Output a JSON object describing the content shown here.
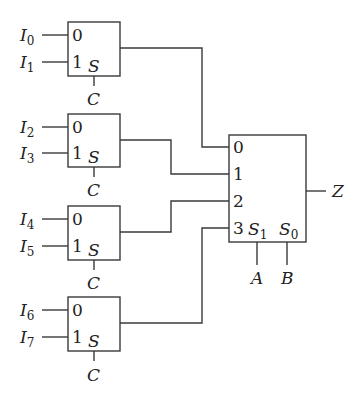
{
  "diagram": {
    "colors": {
      "line": "#3a3a3a",
      "text": "#222222",
      "background": "#ffffff"
    },
    "first_stage": [
      {
        "id": "mux2-0",
        "inputs": [
          {
            "name": "I",
            "sub": "0"
          },
          {
            "name": "I",
            "sub": "1"
          }
        ],
        "pin_labels": [
          "0",
          "1"
        ],
        "select_pin": "S",
        "select_signal": "C",
        "feeds": "0"
      },
      {
        "id": "mux2-1",
        "inputs": [
          {
            "name": "I",
            "sub": "2"
          },
          {
            "name": "I",
            "sub": "3"
          }
        ],
        "pin_labels": [
          "0",
          "1"
        ],
        "select_pin": "S",
        "select_signal": "C",
        "feeds": "1"
      },
      {
        "id": "mux2-2",
        "inputs": [
          {
            "name": "I",
            "sub": "4"
          },
          {
            "name": "I",
            "sub": "5"
          }
        ],
        "pin_labels": [
          "0",
          "1"
        ],
        "select_pin": "S",
        "select_signal": "C",
        "feeds": "2"
      },
      {
        "id": "mux2-3",
        "inputs": [
          {
            "name": "I",
            "sub": "6"
          },
          {
            "name": "I",
            "sub": "7"
          }
        ],
        "pin_labels": [
          "0",
          "1"
        ],
        "select_pin": "S",
        "select_signal": "C",
        "feeds": "3"
      }
    ],
    "second_stage": {
      "id": "mux4",
      "pin_labels": [
        "0",
        "1",
        "2",
        "3"
      ],
      "select_pins": [
        {
          "name": "S",
          "sub": "1",
          "signal": "A"
        },
        {
          "name": "S",
          "sub": "0",
          "signal": "B"
        }
      ],
      "output": "Z"
    }
  }
}
